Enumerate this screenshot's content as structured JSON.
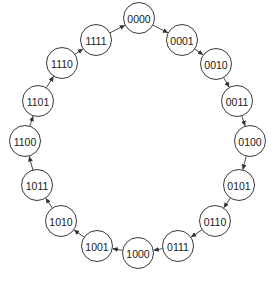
{
  "diagram": {
    "title": "",
    "type": "ring-state-sequence",
    "direction": "clockwise",
    "node_radius": 15.5,
    "colors": {
      "stroke": "#3a3a3a",
      "fill": "#ffffff",
      "text": "#1a1a1a",
      "arrow": "#333333"
    },
    "nodes": [
      {
        "id": "n0",
        "label": "0000",
        "x": 139,
        "y": 18
      },
      {
        "id": "n1",
        "label": "0001",
        "x": 182,
        "y": 40
      },
      {
        "id": "n2",
        "label": "0010",
        "x": 216,
        "y": 64
      },
      {
        "id": "n3",
        "label": "0011",
        "x": 237,
        "y": 101
      },
      {
        "id": "n4",
        "label": "0100",
        "x": 250,
        "y": 141
      },
      {
        "id": "n5",
        "label": "0101",
        "x": 239,
        "y": 185
      },
      {
        "id": "n6",
        "label": "0110",
        "x": 215,
        "y": 221
      },
      {
        "id": "n7",
        "label": "0111",
        "x": 178,
        "y": 246
      },
      {
        "id": "n8",
        "label": "1000",
        "x": 138,
        "y": 253
      },
      {
        "id": "n9",
        "label": "1001",
        "x": 97,
        "y": 246
      },
      {
        "id": "n10",
        "label": "1010",
        "x": 61,
        "y": 221
      },
      {
        "id": "n11",
        "label": "1011",
        "x": 37,
        "y": 185
      },
      {
        "id": "n12",
        "label": "1100",
        "x": 25,
        "y": 141
      },
      {
        "id": "n13",
        "label": "1101",
        "x": 38,
        "y": 101
      },
      {
        "id": "n14",
        "label": "1110",
        "x": 62,
        "y": 63
      },
      {
        "id": "n15",
        "label": "1111",
        "x": 96,
        "y": 40
      }
    ],
    "edges": [
      {
        "from": "n0",
        "to": "n1"
      },
      {
        "from": "n1",
        "to": "n2"
      },
      {
        "from": "n2",
        "to": "n3"
      },
      {
        "from": "n3",
        "to": "n4"
      },
      {
        "from": "n4",
        "to": "n5"
      },
      {
        "from": "n5",
        "to": "n6"
      },
      {
        "from": "n6",
        "to": "n7"
      },
      {
        "from": "n7",
        "to": "n8"
      },
      {
        "from": "n8",
        "to": "n9"
      },
      {
        "from": "n9",
        "to": "n10"
      },
      {
        "from": "n10",
        "to": "n11"
      },
      {
        "from": "n11",
        "to": "n12"
      },
      {
        "from": "n12",
        "to": "n13"
      },
      {
        "from": "n13",
        "to": "n14"
      },
      {
        "from": "n14",
        "to": "n15"
      },
      {
        "from": "n15",
        "to": "n0"
      }
    ]
  }
}
